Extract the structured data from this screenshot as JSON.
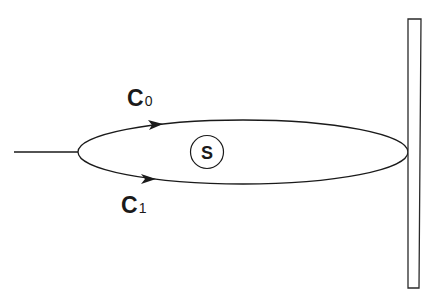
{
  "diagram": {
    "labels": {
      "path_top": {
        "main": "C",
        "sub": "0"
      },
      "path_bottom": {
        "main": "C",
        "sub": "1"
      },
      "source": "S"
    },
    "colors": {
      "stroke": "#1a1a1a",
      "background": "#ffffff"
    },
    "elements": [
      "input-line",
      "closed-loop-ellipse",
      "arrow-top-path",
      "arrow-bottom-path",
      "source-circle",
      "wall-rectangle"
    ]
  }
}
